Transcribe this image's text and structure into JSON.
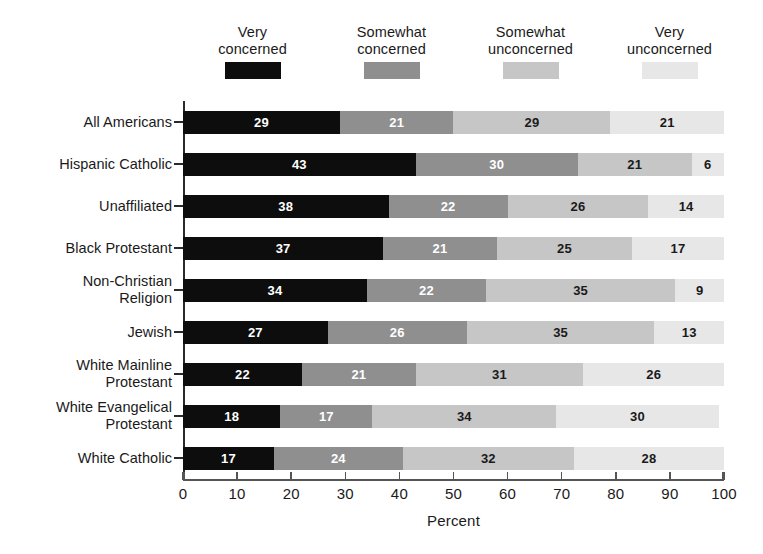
{
  "chart_data": {
    "type": "bar",
    "orientation": "horizontal",
    "stacked": true,
    "normalized_percent": true,
    "title": "",
    "xlabel": "Percent",
    "ylabel": "",
    "xlim": [
      0,
      100
    ],
    "xticks": [
      0,
      10,
      20,
      30,
      40,
      50,
      60,
      70,
      80,
      90,
      100
    ],
    "xticklabels": [
      "0",
      "10",
      "20",
      "30",
      "40",
      "50",
      "60",
      "70",
      "80",
      "90",
      "100"
    ],
    "grid": false,
    "legend_position": "top",
    "categories": [
      "All Americans",
      "Hispanic Catholic",
      "Unaffiliated",
      "Black Protestant",
      "Non-Christian\nReligion",
      "Jewish",
      "White Mainline\nProtestant",
      "White Evangelical\nProtestant",
      "White Catholic"
    ],
    "series": [
      {
        "name": "Very\nconcerned",
        "color": "#0d0d0d",
        "values": [
          29,
          43,
          38,
          37,
          34,
          27,
          22,
          18,
          17
        ]
      },
      {
        "name": "Somewhat\nconcerned",
        "color": "#8f8f8f",
        "values": [
          21,
          30,
          22,
          21,
          22,
          26,
          21,
          17,
          24
        ]
      },
      {
        "name": "Somewhat\nunconcerned",
        "color": "#c6c6c6",
        "values": [
          29,
          21,
          26,
          25,
          35,
          35,
          31,
          34,
          32
        ]
      },
      {
        "name": "Very\nunconcerned",
        "color": "#e7e7e7",
        "values": [
          21,
          6,
          14,
          17,
          9,
          13,
          26,
          30,
          28
        ]
      }
    ]
  },
  "legend": {
    "items": [
      {
        "label": "Very\nconcerned",
        "swatch_class": "sw0",
        "color": "#0d0d0d"
      },
      {
        "label": "Somewhat\nconcerned",
        "swatch_class": "sw1",
        "color": "#8f8f8f"
      },
      {
        "label": "Somewhat\nunconcerned",
        "swatch_class": "sw2",
        "color": "#c6c6c6"
      },
      {
        "label": "Very\nunconcerned",
        "swatch_class": "sw3",
        "color": "#e7e7e7"
      }
    ]
  },
  "axis": {
    "x_title": "Percent"
  }
}
